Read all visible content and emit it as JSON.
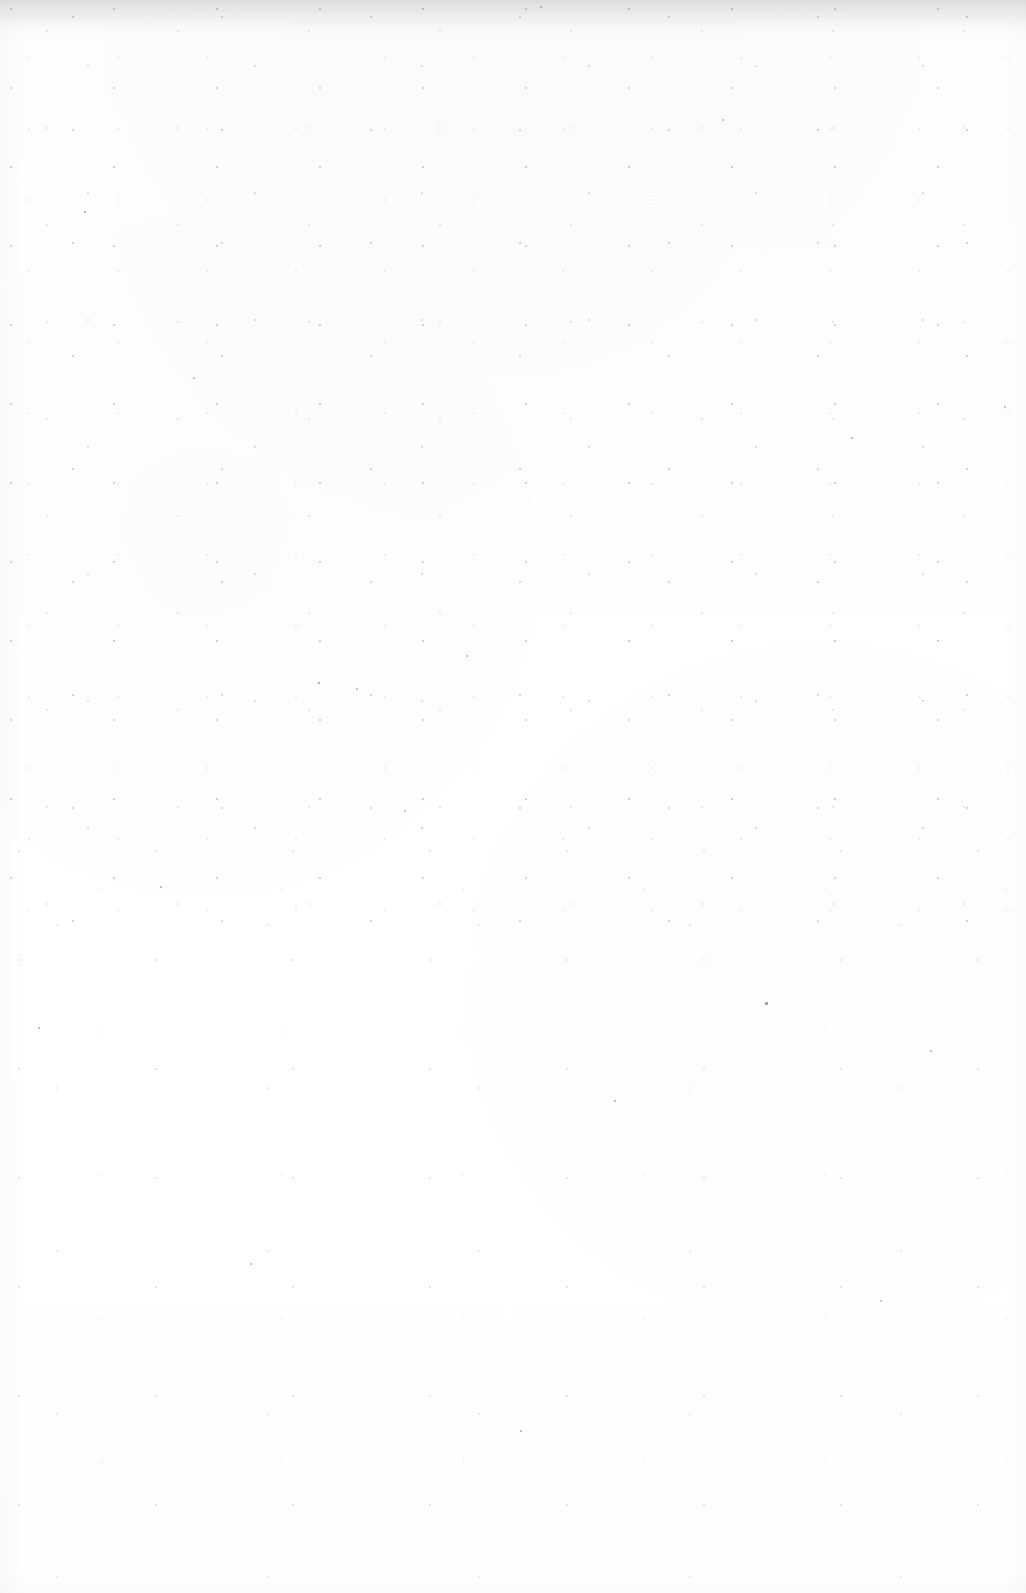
{
  "page": {
    "kind": "scanned-document-page",
    "state": "blank",
    "width": 1026,
    "height": 1593,
    "background_color": "#fefefe",
    "paper_tone": "#fdfdfd",
    "visible_text": "",
    "header_text": "",
    "footer_text": "",
    "page_number": "",
    "body_text": ""
  },
  "artifacts": {
    "speck_color": "#55555c",
    "streak_color": "#787880",
    "description": "",
    "specks": [
      {
        "x": 84,
        "y": 211,
        "size": 2.0,
        "opacity": 0.55
      },
      {
        "x": 540,
        "y": 6,
        "size": 2.4,
        "opacity": 0.5
      },
      {
        "x": 318,
        "y": 682,
        "size": 2.2,
        "opacity": 0.58
      },
      {
        "x": 356,
        "y": 688,
        "size": 1.8,
        "opacity": 0.45
      },
      {
        "x": 851,
        "y": 437,
        "size": 2.1,
        "opacity": 0.52
      },
      {
        "x": 765,
        "y": 1002,
        "size": 2.6,
        "opacity": 0.62
      },
      {
        "x": 1004,
        "y": 406,
        "size": 2.0,
        "opacity": 0.48
      },
      {
        "x": 38,
        "y": 1027,
        "size": 1.9,
        "opacity": 0.5
      },
      {
        "x": 250,
        "y": 1263,
        "size": 2.0,
        "opacity": 0.46
      },
      {
        "x": 466,
        "y": 655,
        "size": 1.8,
        "opacity": 0.44
      },
      {
        "x": 614,
        "y": 1100,
        "size": 1.7,
        "opacity": 0.42
      },
      {
        "x": 930,
        "y": 1050,
        "size": 1.9,
        "opacity": 0.45
      },
      {
        "x": 193,
        "y": 377,
        "size": 1.7,
        "opacity": 0.4
      },
      {
        "x": 722,
        "y": 119,
        "size": 2.0,
        "opacity": 0.47
      },
      {
        "x": 404,
        "y": 810,
        "size": 1.8,
        "opacity": 0.43
      },
      {
        "x": 160,
        "y": 886,
        "size": 1.7,
        "opacity": 0.41
      },
      {
        "x": 880,
        "y": 1300,
        "size": 1.8,
        "opacity": 0.43
      },
      {
        "x": 520,
        "y": 1430,
        "size": 1.7,
        "opacity": 0.4
      }
    ]
  }
}
